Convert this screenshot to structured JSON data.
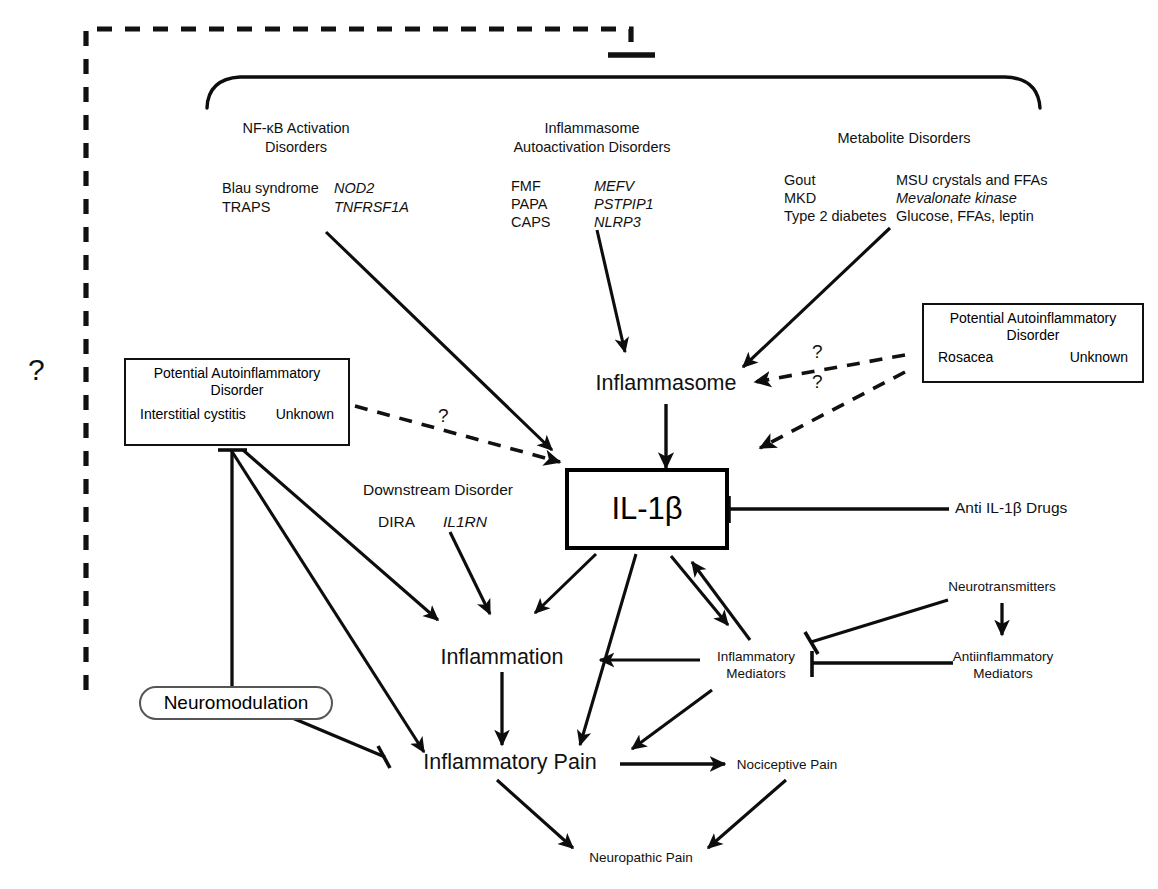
{
  "groups": {
    "nfkb": {
      "title_line1": "NF-κB Activation",
      "title_line2": "Disorders",
      "diseases": [
        "Blau syndrome",
        "TRAPS"
      ],
      "genes": [
        "NOD2",
        "TNFRSF1A"
      ]
    },
    "inflammasome": {
      "title_line1": "Inflammasome",
      "title_line2": "Autoactivation Disorders",
      "diseases": [
        "FMF",
        "PAPA",
        "CAPS"
      ],
      "genes": [
        "MEFV",
        "PSTPIP1",
        "NLRP3"
      ]
    },
    "metabolite": {
      "title_line1": "Metabolite Disorders",
      "title_line2": "",
      "diseases": [
        "Gout",
        "MKD",
        "Type 2 diabetes"
      ],
      "genes": [
        "MSU crystals and FFAs",
        "Mevalonate kinase",
        "Glucose, FFAs, leptin"
      ],
      "gene_italic_flags": [
        false,
        true,
        false
      ]
    },
    "downstream": {
      "title": "Downstream Disorder",
      "disease": "DIRA",
      "gene": "IL1RN"
    }
  },
  "potential_boxes": [
    {
      "id": "cystitis",
      "title_line1": "Potential Autoinflammatory",
      "title_line2": "Disorder",
      "left": "Interstitial cystitis",
      "right": "Unknown"
    },
    {
      "id": "rosacea",
      "title_line1": "Potential Autoinflammatory",
      "title_line2": "Disorder",
      "left": "Rosacea",
      "right": "Unknown"
    }
  ],
  "nodes": {
    "inflammasome": "Inflammasome",
    "il1b": "IL-1β",
    "anti_drugs": "Anti IL-1β Drugs",
    "inflammation": "Inflammation",
    "inflammatory_mediators_l1": "Inflammatory",
    "inflammatory_mediators_l2": "Mediators",
    "antiinflammatory_mediators_l1": "Antiinflammatory",
    "antiinflammatory_mediators_l2": "Mediators",
    "neurotransmitters": "Neurotransmitters",
    "neuromodulation": "Neuromodulation",
    "inflammatory_pain": "Inflammatory Pain",
    "nociceptive_pain": "Nociceptive Pain",
    "neuropathic_pain": "Neuropathic Pain"
  },
  "question_marks": {
    "outer": "?",
    "cystitis_link": "?",
    "rosacea_upper": "?",
    "rosacea_lower": "?"
  },
  "colors": {
    "ink": "#111111",
    "stroke": "#000000",
    "background": "#ffffff"
  }
}
